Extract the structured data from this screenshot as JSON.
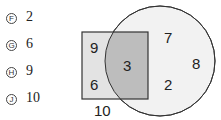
{
  "answer_choices": [
    {
      "letter": "F",
      "value": "2"
    },
    {
      "letter": "G",
      "value": "6"
    },
    {
      "letter": "H",
      "value": "9"
    },
    {
      "letter": "J",
      "value": "10"
    }
  ],
  "venn": {
    "rect_only": [
      "9",
      "6"
    ],
    "intersection": [
      "3"
    ],
    "circle_only": [
      "7",
      "2",
      "8"
    ],
    "outside": [
      "10"
    ]
  },
  "colors": {
    "rect_fill": "#e6e6e6",
    "intersection_fill": "#bdbdbd",
    "circle_fill": "#f2f2f2",
    "stroke": "#333333"
  }
}
